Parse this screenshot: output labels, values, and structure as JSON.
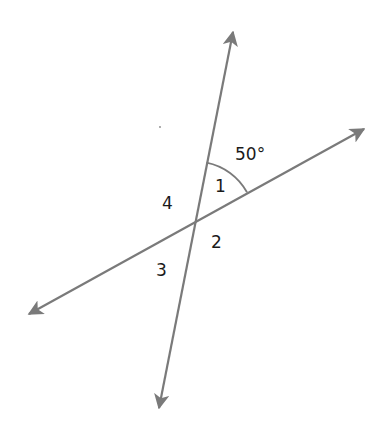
{
  "diagram": {
    "line_color": "#7a7a7a",
    "text_color": "#1a1a1a",
    "intersection": {
      "x": 195,
      "y": 221
    },
    "lines": [
      {
        "name": "steep-line",
        "start": {
          "x": 159,
          "y": 408
        },
        "end": {
          "x": 233,
          "y": 32
        }
      },
      {
        "name": "shallow-line",
        "start": {
          "x": 29,
          "y": 314
        },
        "end": {
          "x": 364,
          "y": 129
        }
      }
    ],
    "angle_given": "50°",
    "labels": {
      "angle1": "1",
      "angle2": "2",
      "angle3": "3",
      "angle4": "4"
    }
  }
}
